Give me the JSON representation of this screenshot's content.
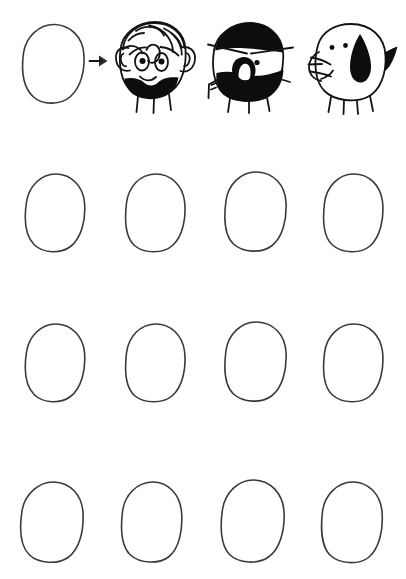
{
  "page": {
    "background_color": "#ffffff",
    "ink_color": "#3a3a3c",
    "fill_color": "#0d0d0f",
    "width": 406,
    "height": 579
  },
  "prompt_row": {
    "label": "Example row",
    "source_shape": {
      "name": "blank-blob",
      "label": "Blank blob"
    },
    "arrow": {
      "name": "right-arrow",
      "glyph": "→",
      "label": "becomes"
    },
    "examples": [
      {
        "name": "curly-hair-bearded-face",
        "label": "Curly haired bearded character",
        "features": [
          "curly hair",
          "two ears",
          "two oval eyes",
          "smile",
          "black beard",
          "three legs"
        ]
      },
      {
        "name": "black-cap-open-mouth-face",
        "label": "Black capped character with open mouth",
        "features": [
          "black hair cap",
          "brow bar",
          "two dot eyes",
          "open mouth",
          "black beard",
          "arm",
          "legs"
        ]
      },
      {
        "name": "snouted-creature",
        "label": "Snouted creature with teardrop marking",
        "features": [
          "snout with whiskers",
          "two dot eyes",
          "black teardrop",
          "tail",
          "four legs"
        ]
      }
    ]
  },
  "grid": {
    "label": "Blank blobs to complete",
    "rows": 3,
    "columns": 4,
    "cells": [
      {
        "name": "blank-blob-r1c1",
        "label": "Blank blob row 1 column 1"
      },
      {
        "name": "blank-blob-r1c2",
        "label": "Blank blob row 1 column 2"
      },
      {
        "name": "blank-blob-r1c3",
        "label": "Blank blob row 1 column 3"
      },
      {
        "name": "blank-blob-r1c4",
        "label": "Blank blob row 1 column 4"
      },
      {
        "name": "blank-blob-r2c1",
        "label": "Blank blob row 2 column 1"
      },
      {
        "name": "blank-blob-r2c2",
        "label": "Blank blob row 2 column 2"
      },
      {
        "name": "blank-blob-r2c3",
        "label": "Blank blob row 2 column 3"
      },
      {
        "name": "blank-blob-r2c4",
        "label": "Blank blob row 2 column 4"
      },
      {
        "name": "blank-blob-r3c1",
        "label": "Blank blob row 3 column 1"
      },
      {
        "name": "blank-blob-r3c2",
        "label": "Blank blob row 3 column 2"
      },
      {
        "name": "blank-blob-r3c3",
        "label": "Blank blob row 3 column 3"
      },
      {
        "name": "blank-blob-r3c4",
        "label": "Blank blob row 3 column 4"
      }
    ]
  }
}
